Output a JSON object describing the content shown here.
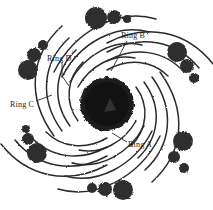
{
  "figure": {
    "name": "spiral-ring-pinwheel-diagram",
    "background_color": "#ffffff",
    "stroke_color": "#2b2b2b",
    "blob_color": "#2e2e2e",
    "core_color": "#1a1a1a",
    "width": 213,
    "height": 210
  },
  "labels": {
    "ring_a": "Ring A",
    "ring_b": "Ring B",
    "ring_c": "Ring C",
    "ring_d": "Ring D"
  },
  "core": {
    "center_x": 107,
    "center_y": 104,
    "radius": 27
  },
  "rings": [
    {
      "id": "ring-a",
      "radius": 34
    },
    {
      "id": "ring-b",
      "radius": 43
    },
    {
      "id": "ring-c",
      "radius": 52
    },
    {
      "id": "ring-d",
      "radius": 61
    }
  ],
  "arms": [
    {
      "id": "arm-1",
      "angle_deg": 270
    },
    {
      "id": "arm-2",
      "angle_deg": 330
    },
    {
      "id": "arm-3",
      "angle_deg": 30
    },
    {
      "id": "arm-4",
      "angle_deg": 90
    },
    {
      "id": "arm-5",
      "angle_deg": 150
    },
    {
      "id": "arm-6",
      "angle_deg": 210
    }
  ],
  "bead_clusters": [
    {
      "id": "cluster-top",
      "beads": [
        {
          "cx": 96,
          "cy": 18,
          "r": 11
        },
        {
          "cx": 114,
          "cy": 17,
          "r": 7
        },
        {
          "cx": 127,
          "cy": 19,
          "r": 4
        }
      ]
    },
    {
      "id": "cluster-top-right",
      "beads": [
        {
          "cx": 177,
          "cy": 52,
          "r": 10
        },
        {
          "cx": 187,
          "cy": 66,
          "r": 7
        },
        {
          "cx": 194,
          "cy": 78,
          "r": 5
        }
      ]
    },
    {
      "id": "cluster-bottom-right",
      "beads": [
        {
          "cx": 183,
          "cy": 141,
          "r": 10
        },
        {
          "cx": 174,
          "cy": 157,
          "r": 6
        },
        {
          "cx": 184,
          "cy": 168,
          "r": 5
        }
      ]
    },
    {
      "id": "cluster-bottom",
      "beads": [
        {
          "cx": 123,
          "cy": 190,
          "r": 10
        },
        {
          "cx": 105,
          "cy": 189,
          "r": 7
        },
        {
          "cx": 92,
          "cy": 188,
          "r": 5
        }
      ]
    },
    {
      "id": "cluster-bottom-left",
      "beads": [
        {
          "cx": 37,
          "cy": 153,
          "r": 10
        },
        {
          "cx": 28,
          "cy": 139,
          "r": 6
        },
        {
          "cx": 26,
          "cy": 129,
          "r": 4
        }
      ]
    },
    {
      "id": "cluster-top-left",
      "beads": [
        {
          "cx": 28,
          "cy": 70,
          "r": 10
        },
        {
          "cx": 34,
          "cy": 55,
          "r": 7
        },
        {
          "cx": 43,
          "cy": 45,
          "r": 5
        }
      ]
    }
  ],
  "leader_lines": [
    {
      "id": "leader-ring-a",
      "d": "M 127 142 L 112 133"
    },
    {
      "id": "leader-ring-b",
      "d": "M 127 41 L 111 71"
    },
    {
      "id": "leader-ring-c",
      "d": "M 36 101 L 52 95"
    },
    {
      "id": "leader-ring-d",
      "d": "M 62 62 L 62 76 L 69 86"
    }
  ]
}
